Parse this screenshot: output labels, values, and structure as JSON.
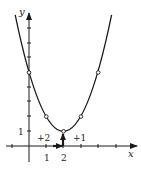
{
  "figure": {
    "type": "parabola-graph",
    "function": "f(x) = (x - 2)^2 + 1",
    "axes": {
      "x_label": "x",
      "y_label": "y",
      "x_tick_labels": [
        "1",
        "2"
      ],
      "y_tick_labels": [
        "1"
      ]
    },
    "vertex": [
      2,
      1
    ],
    "marked_points": [
      [
        0,
        5
      ],
      [
        1,
        2
      ],
      [
        2,
        1
      ],
      [
        3,
        2
      ],
      [
        4,
        5
      ]
    ],
    "translation": {
      "horizontal_label": "+2",
      "vertical_label": "+1"
    },
    "colors": {
      "stroke": "#1a1a1a",
      "background": "#ffffff"
    }
  }
}
